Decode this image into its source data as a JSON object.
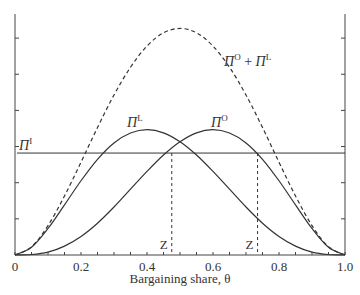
{
  "chart_data": {
    "type": "line",
    "title": "",
    "xlabel": "Bargaining share, θ",
    "ylabel": "",
    "xlim": [
      0,
      1.0
    ],
    "ylim": [
      0,
      1.0
    ],
    "grid": false,
    "legend": "none (curves labeled inline)",
    "x_ticks": [
      0,
      0.2,
      0.4,
      0.6,
      0.8,
      1.0
    ],
    "x_tick_labels": [
      "0",
      "0.2",
      "0.4",
      "0.6",
      "0.8",
      "1.0"
    ],
    "x_minor_ticks_step": 0.05,
    "y_ticks_unlabeled": [
      0.15,
      0.3,
      0.45,
      0.6,
      0.75,
      0.9
    ],
    "x": [
      0,
      0.05,
      0.1,
      0.15,
      0.2,
      0.25,
      0.3,
      0.35,
      0.4,
      0.45,
      0.5,
      0.55,
      0.6,
      0.65,
      0.7,
      0.75,
      0.8,
      0.85,
      0.9,
      0.95,
      1.0
    ],
    "series": [
      {
        "name": "ΠL",
        "label_main": "Π",
        "label_sup": "L",
        "style": "solid",
        "values": [
          0,
          0.032,
          0.11,
          0.208,
          0.308,
          0.397,
          0.465,
          0.506,
          0.52,
          0.507,
          0.47,
          0.415,
          0.347,
          0.273,
          0.199,
          0.132,
          0.077,
          0.037,
          0.012,
          0.002,
          0
        ]
      },
      {
        "name": "ΠO",
        "label_main": "Π",
        "label_sup": "O",
        "style": "solid",
        "values": [
          0,
          0.002,
          0.012,
          0.037,
          0.077,
          0.132,
          0.199,
          0.273,
          0.347,
          0.415,
          0.47,
          0.507,
          0.52,
          0.506,
          0.465,
          0.397,
          0.308,
          0.208,
          0.11,
          0.032,
          0
        ]
      },
      {
        "name": "ΠO + ΠL",
        "label_main": "Π",
        "label_sup": "O",
        "label_plus": " + ",
        "label_main2": "Π",
        "label_sup2": "L",
        "style": "dashed",
        "values": [
          0,
          0.034,
          0.122,
          0.245,
          0.385,
          0.529,
          0.664,
          0.779,
          0.867,
          0.922,
          0.94,
          0.922,
          0.867,
          0.779,
          0.664,
          0.529,
          0.385,
          0.245,
          0.122,
          0.034,
          0
        ]
      },
      {
        "name": "ΠI",
        "label_main": "Π",
        "label_sup": "I",
        "style": "solid-horizontal",
        "constant": 0.423
      }
    ],
    "annotations": [
      {
        "text": "Z",
        "x": 0.475,
        "style": "dashed vertical from ΠI intersection with ΠO down to x-axis"
      },
      {
        "text": "Z",
        "x": 0.735,
        "style": "dashed vertical from ΠI intersection with ΠO+ΠL down to x-axis"
      }
    ]
  }
}
